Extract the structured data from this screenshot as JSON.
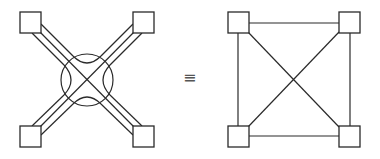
{
  "diagram": {
    "left": {
      "description": "four nodes connected via triple-line bundles through a central circular crossbar",
      "nodes": [
        {
          "id": "tl",
          "x": 20,
          "y": 12,
          "w": 21,
          "h": 21
        },
        {
          "id": "tr",
          "x": 133,
          "y": 12,
          "w": 21,
          "h": 21
        },
        {
          "id": "bl",
          "x": 20,
          "y": 126,
          "w": 21,
          "h": 21
        },
        {
          "id": "br",
          "x": 133,
          "y": 126,
          "w": 21,
          "h": 21
        }
      ],
      "hub": {
        "cx": 87,
        "cy": 80,
        "r": 26
      }
    },
    "equivalence_symbol": "≡",
    "right": {
      "description": "complete graph on four nodes",
      "nodes": [
        {
          "id": "tl",
          "x": 228,
          "y": 12,
          "w": 21,
          "h": 21
        },
        {
          "id": "tr",
          "x": 339,
          "y": 12,
          "w": 21,
          "h": 21
        },
        {
          "id": "bl",
          "x": 228,
          "y": 126,
          "w": 21,
          "h": 21
        },
        {
          "id": "br",
          "x": 339,
          "y": 126,
          "w": 21,
          "h": 21
        }
      ],
      "edges": [
        [
          "tl",
          "tr"
        ],
        [
          "bl",
          "br"
        ],
        [
          "tl",
          "bl"
        ],
        [
          "tr",
          "br"
        ],
        [
          "tl",
          "br"
        ],
        [
          "tr",
          "bl"
        ]
      ]
    },
    "colors": {
      "stroke": "#2a2a2a",
      "background": "#ffffff"
    }
  }
}
